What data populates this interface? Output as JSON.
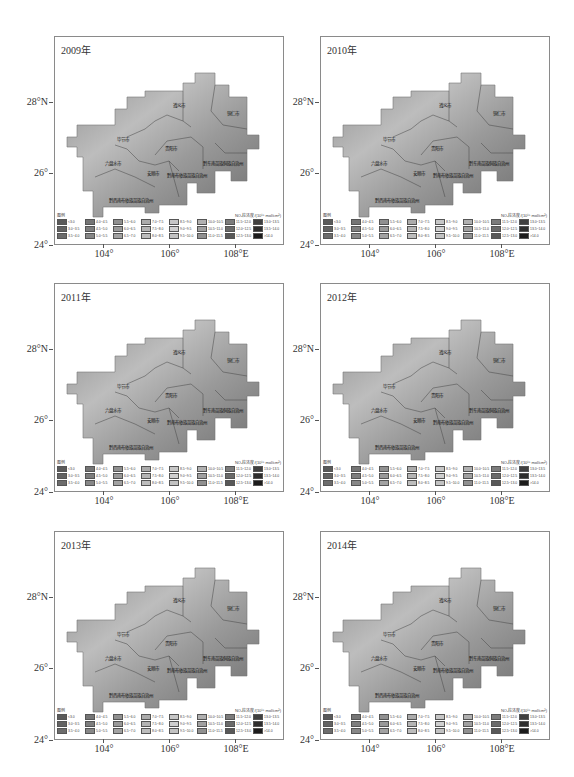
{
  "figure": {
    "unit_label": "NO₂柱浓度/(10¹⁵ mol/cm²)",
    "legend_title": "图例",
    "x_ticks": [
      "104°",
      "106°",
      "108°E"
    ],
    "y_ticks": [
      "28°N",
      "26°",
      "24°"
    ],
    "regions": [
      "遵义市",
      "铜仁市",
      "毕节市",
      "贵阳市",
      "黔东南苗族侗族自治州",
      "六盘水市",
      "安顺市",
      "黔南布依族苗族自治州",
      "黔西南布依族苗族自治州"
    ],
    "legend_classes": [
      {
        "label": "<3.0",
        "color": "#5a5a5a"
      },
      {
        "label": "3.0~3.5",
        "color": "#636363"
      },
      {
        "label": "3.5~4.0",
        "color": "#6c6c6c"
      },
      {
        "label": "4.0~4.5",
        "color": "#757575"
      },
      {
        "label": "4.5~5.0",
        "color": "#7e7e7e"
      },
      {
        "label": "5.0~5.5",
        "color": "#878787"
      },
      {
        "label": "5.5~6.0",
        "color": "#909090"
      },
      {
        "label": "6.0~6.5",
        "color": "#999999"
      },
      {
        "label": "6.5~7.0",
        "color": "#a2a2a2"
      },
      {
        "label": "7.0~7.5",
        "color": "#ababab"
      },
      {
        "label": "7.5~8.0",
        "color": "#b4b4b4"
      },
      {
        "label": "8.0~8.5",
        "color": "#bdbdbd"
      },
      {
        "label": "8.5~9.0",
        "color": "#c6c6c6"
      },
      {
        "label": "9.0~9.5",
        "color": "#cfcfcf"
      },
      {
        "label": "9.5~10.0",
        "color": "#c2c2c2"
      },
      {
        "label": "10.0~10.5",
        "color": "#b0b0b0"
      },
      {
        "label": "10.5~11.0",
        "color": "#a0a0a0"
      },
      {
        "label": "11.0~11.5",
        "color": "#909090"
      },
      {
        "label": "11.5~12.0",
        "color": "#7c7c7c"
      },
      {
        "label": "12.0~12.5",
        "color": "#6a6a6a"
      },
      {
        "label": "12.5~13.0",
        "color": "#585858"
      },
      {
        "label": "13.0~13.5",
        "color": "#404040"
      },
      {
        "label": "13.5~14.0",
        "color": "#2e2e2e"
      },
      {
        "label": ">14.0",
        "color": "#1c1c1c"
      }
    ]
  },
  "panels": [
    {
      "title": "2009年"
    },
    {
      "title": "2010年"
    },
    {
      "title": "2011年"
    },
    {
      "title": "2012年"
    },
    {
      "title": "2013年"
    },
    {
      "title": "2014年"
    }
  ]
}
